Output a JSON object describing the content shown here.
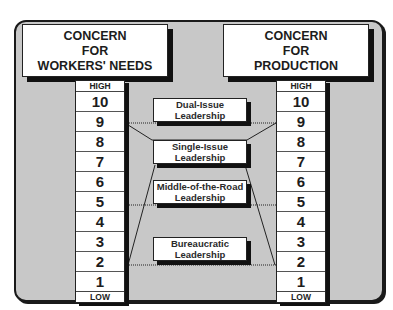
{
  "title_partial": "Leadership Strategy Diagram",
  "left_header": {
    "lines": [
      "CONCERN",
      "FOR",
      "WORKERS' NEEDS"
    ]
  },
  "right_header": {
    "lines": [
      "CONCERN",
      "FOR",
      "PRODUCTION"
    ]
  },
  "left_scale": {
    "high_label": "HIGH",
    "low_label": "LOW",
    "values": [
      "10",
      "9",
      "8",
      "7",
      "6",
      "5",
      "4",
      "3",
      "2",
      "1"
    ]
  },
  "right_scale": {
    "high_label": "HIGH",
    "low_label": "LOW",
    "values": [
      "10",
      "9",
      "8",
      "7",
      "6",
      "5",
      "4",
      "3",
      "2",
      "1"
    ]
  },
  "leadership_styles": [
    {
      "line1": "Dual-Issue",
      "line2": "Leadership"
    },
    {
      "line1": "Single-Issue",
      "line2": "Leadership"
    },
    {
      "line1": "Middle-of-the-Road",
      "line2": "Leadership"
    },
    {
      "line1": "Bureaucratic",
      "line2": "Leadership"
    }
  ],
  "colors": {
    "panel_fill": "#c8c8c8",
    "box_fill": "#ffffff",
    "ink": "#1a1a1a"
  }
}
